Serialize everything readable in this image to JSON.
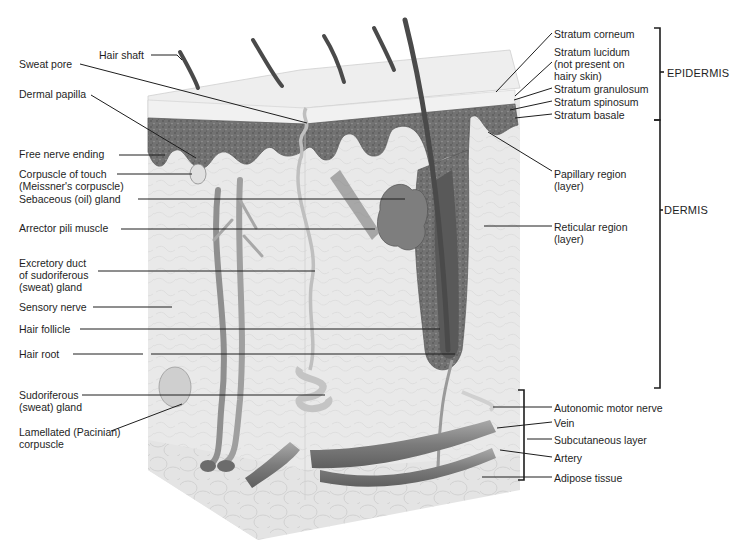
{
  "colors": {
    "background": "#ffffff",
    "tissue": "#e6e6e6",
    "epidermis_dark": "#6e6e6e",
    "stratum_corneum": "#ececec",
    "hair": "#4a4a4a",
    "vessel": "#8a8a8a",
    "leader_line": "#1e1e1e"
  },
  "left_labels": [
    {
      "id": "hair-shaft",
      "lines": [
        "Hair shaft"
      ],
      "x": 99,
      "y": 49
    },
    {
      "id": "sweat-pore",
      "lines": [
        "Sweat pore"
      ],
      "x": 19,
      "y": 58
    },
    {
      "id": "dermal-papilla",
      "lines": [
        "Dermal papilla"
      ],
      "x": 19,
      "y": 88
    },
    {
      "id": "free-nerve-ending",
      "lines": [
        "Free nerve ending"
      ],
      "x": 19,
      "y": 148
    },
    {
      "id": "corpuscle-of-touch",
      "lines": [
        "Corpuscle of touch",
        "(Meissner's corpuscle)"
      ],
      "x": 19,
      "y": 168
    },
    {
      "id": "sebaceous-gland",
      "lines": [
        "Sebaceous (oil) gland"
      ],
      "x": 19,
      "y": 193
    },
    {
      "id": "arrector-pili",
      "lines": [
        "Arrector pili muscle"
      ],
      "x": 19,
      "y": 222
    },
    {
      "id": "excretory-duct",
      "lines": [
        "Excretory duct",
        "of sudoriferous",
        "(sweat) gland"
      ],
      "x": 19,
      "y": 257
    },
    {
      "id": "sensory-nerve",
      "lines": [
        "Sensory nerve"
      ],
      "x": 19,
      "y": 301
    },
    {
      "id": "hair-follicle",
      "lines": [
        "Hair follicle"
      ],
      "x": 19,
      "y": 323
    },
    {
      "id": "hair-root",
      "lines": [
        "Hair root"
      ],
      "x": 19,
      "y": 348
    },
    {
      "id": "sudoriferous-gland",
      "lines": [
        "Sudoriferous",
        "(sweat) gland"
      ],
      "x": 19,
      "y": 389
    },
    {
      "id": "lamellated-corpuscle",
      "lines": [
        "Lamellated (Pacinian)",
        "corpuscle"
      ],
      "x": 19,
      "y": 426
    }
  ],
  "right_labels": [
    {
      "id": "stratum-corneum",
      "lines": [
        "Stratum corneum"
      ],
      "x": 554,
      "y": 28
    },
    {
      "id": "stratum-lucidum",
      "lines": [
        "Stratum lucidum",
        "(not present on",
        "hairy skin)"
      ],
      "x": 554,
      "y": 46
    },
    {
      "id": "stratum-granulosum",
      "lines": [
        "Stratum granulosum"
      ],
      "x": 554,
      "y": 83
    },
    {
      "id": "stratum-spinosum",
      "lines": [
        "Stratum spinosum"
      ],
      "x": 554,
      "y": 96
    },
    {
      "id": "stratum-basale",
      "lines": [
        "Stratum basale"
      ],
      "x": 554,
      "y": 109
    },
    {
      "id": "papillary-region",
      "lines": [
        "Papillary region",
        "(layer)"
      ],
      "x": 554,
      "y": 168
    },
    {
      "id": "reticular-region",
      "lines": [
        "Reticular region",
        "(layer)"
      ],
      "x": 554,
      "y": 221
    },
    {
      "id": "autonomic-motor-nerve",
      "lines": [
        "Autonomic motor nerve"
      ],
      "x": 554,
      "y": 402
    },
    {
      "id": "vein",
      "lines": [
        "Vein"
      ],
      "x": 554,
      "y": 417
    },
    {
      "id": "subcutaneous-layer",
      "lines": [
        "Subcutaneous layer"
      ],
      "x": 554,
      "y": 434
    },
    {
      "id": "artery",
      "lines": [
        "Artery"
      ],
      "x": 554,
      "y": 452
    },
    {
      "id": "adipose-tissue",
      "lines": [
        "Adipose tissue"
      ],
      "x": 554,
      "y": 472
    }
  ],
  "regions": [
    {
      "id": "epidermis",
      "label": "EPIDERMIS",
      "x": 667,
      "y": 67
    },
    {
      "id": "dermis",
      "label": "DERMIS",
      "x": 664,
      "y": 204
    }
  ]
}
